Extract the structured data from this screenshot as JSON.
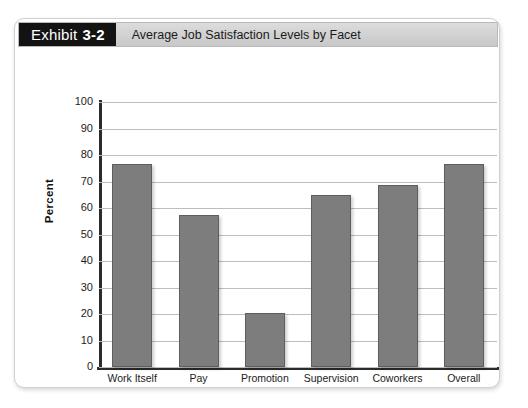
{
  "exhibit": {
    "tag_label": "Exhibit",
    "tag_number": "3-2",
    "title": "Average Job Satisfaction Levels by Facet"
  },
  "colors": {
    "bar_fill": "#7d7d7d",
    "bar_border": "#5e5e5e",
    "gridline": "#bdbdbd",
    "axis": "#2b2b2b",
    "tag_background": "#131313",
    "header_background": "#d4d4d4"
  },
  "chart_data": {
    "type": "bar",
    "title": "Average Job Satisfaction Levels by Facet",
    "xlabel": "",
    "ylabel": "Percent",
    "ylim": [
      0,
      100
    ],
    "yticks": [
      "100",
      "90",
      "80",
      "70",
      "60",
      "50",
      "40",
      "30",
      "20",
      "10",
      "0"
    ],
    "grid": true,
    "legend": "none",
    "categories": [
      "Work Itself",
      "Pay",
      "Promotion",
      "Supervision",
      "Coworkers",
      "Overall"
    ],
    "values": [
      76.5,
      57.5,
      20.5,
      65,
      68.5,
      76.5
    ]
  }
}
